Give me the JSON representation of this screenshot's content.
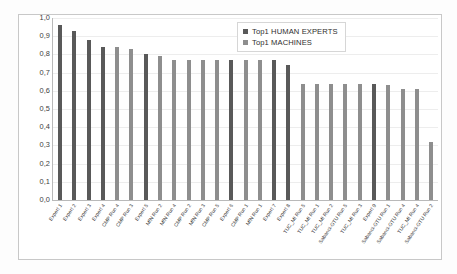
{
  "chart_data": {
    "type": "bar",
    "title": "",
    "subtitle": "",
    "xlabel": "",
    "ylabel": "",
    "ylim": [
      0.0,
      1.0
    ],
    "grid": true,
    "legend_position": "top-right",
    "y_ticks": [
      "1,0",
      "0,9",
      "0,8",
      "0,7",
      "0,6",
      "0,5",
      "0,4",
      "0,3",
      "0,2",
      "0,1",
      "0,0"
    ],
    "y_tick_values": [
      1.0,
      0.9,
      0.8,
      0.7,
      0.6,
      0.5,
      0.4,
      0.3,
      0.2,
      0.1,
      0.0
    ],
    "legend": [
      {
        "name": "Top1 HUMAN EXPERTS",
        "color": "#595959"
      },
      {
        "name": "Top1 MACHINES",
        "color": "#8e8e8e"
      }
    ],
    "categories": [
      "Expert 1",
      "Expert 2",
      "Expert 3",
      "Expert 4",
      "CMP Run 4",
      "CMP Run 3",
      "Expert 5",
      "MfN Run 2",
      "MfN Run 4",
      "CMP Run 2",
      "MfN Run 3",
      "CMP Run 5",
      "Expert 6",
      "CMP Run 1",
      "MfN Run 1",
      "Expert 7",
      "Expert 8",
      "TUC_MI Run 5",
      "TUC_MI Run 1",
      "TUC_MI Run 2",
      "Sabanci-GTU Run 5",
      "TUC_MI Run 3",
      "Expert 9",
      "Sabanci-GTU Run 1",
      "Sabanci-GTU Run 4",
      "TUC_MI Run 4",
      "Sabanci-GTU Run 2"
    ],
    "series_by_point": [
      "Top1 HUMAN EXPERTS",
      "Top1 HUMAN EXPERTS",
      "Top1 HUMAN EXPERTS",
      "Top1 HUMAN EXPERTS",
      "Top1 MACHINES",
      "Top1 MACHINES",
      "Top1 HUMAN EXPERTS",
      "Top1 MACHINES",
      "Top1 MACHINES",
      "Top1 MACHINES",
      "Top1 MACHINES",
      "Top1 MACHINES",
      "Top1 HUMAN EXPERTS",
      "Top1 MACHINES",
      "Top1 MACHINES",
      "Top1 HUMAN EXPERTS",
      "Top1 HUMAN EXPERTS",
      "Top1 MACHINES",
      "Top1 MACHINES",
      "Top1 MACHINES",
      "Top1 MACHINES",
      "Top1 MACHINES",
      "Top1 HUMAN EXPERTS",
      "Top1 MACHINES",
      "Top1 MACHINES",
      "Top1 MACHINES",
      "Top1 MACHINES"
    ],
    "values": [
      0.96,
      0.93,
      0.88,
      0.84,
      0.84,
      0.83,
      0.8,
      0.79,
      0.77,
      0.77,
      0.77,
      0.77,
      0.77,
      0.77,
      0.77,
      0.77,
      0.74,
      0.64,
      0.64,
      0.64,
      0.64,
      0.64,
      0.64,
      0.63,
      0.61,
      0.61,
      0.32
    ]
  }
}
